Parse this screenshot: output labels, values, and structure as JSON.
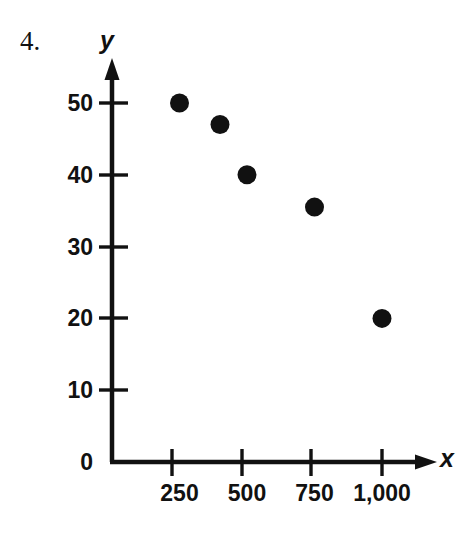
{
  "figure": {
    "problem_number": "4.",
    "x_axis_label": "x",
    "y_axis_label": "y",
    "axis_color": "#111111",
    "point_color": "#111111",
    "background_color": "#ffffff"
  },
  "chart_data": {
    "type": "scatter",
    "title": "",
    "subtitle": "",
    "xlabel": "x",
    "ylabel": "y",
    "x": [
      250,
      400,
      500,
      750,
      1000
    ],
    "y": [
      50,
      47,
      40,
      35.5,
      20
    ],
    "points": [
      {
        "x": 250,
        "y": 50
      },
      {
        "x": 400,
        "y": 47
      },
      {
        "x": 500,
        "y": 40
      },
      {
        "x": 750,
        "y": 35.5
      },
      {
        "x": 1000,
        "y": 20
      }
    ],
    "xlim": [
      0,
      1110
    ],
    "ylim": [
      0,
      55
    ],
    "xticks": [
      250,
      500,
      750,
      1000
    ],
    "yticks": [
      0,
      10,
      20,
      30,
      40,
      50
    ],
    "xticklabels": [
      "250",
      "500",
      "750",
      "1,000"
    ],
    "yticklabels": [
      "0",
      "10",
      "20",
      "30",
      "40",
      "50"
    ],
    "grid": false,
    "legend": null,
    "annotations": [
      "4."
    ],
    "axis_style": "arrow-headed L-shaped axes, origin at lower left"
  }
}
